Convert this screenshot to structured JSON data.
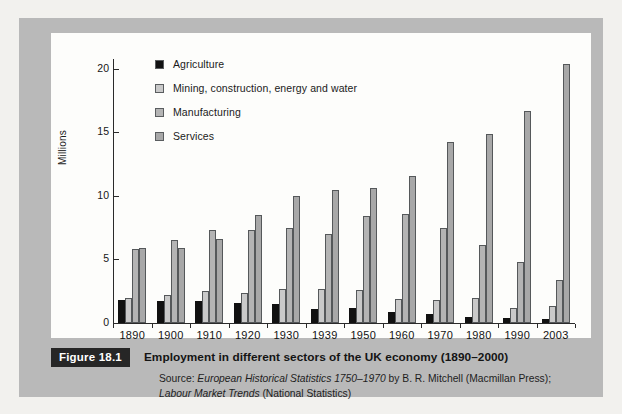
{
  "figure": {
    "badge": "Figure 18.1",
    "title": "Employment in different sectors of the UK economy (1890–2000)",
    "source_prefix": "Source: ",
    "source_italic_1": "European Historical Statistics 1750–1970",
    "source_rest_1": " by B. R. Mitchell (Macmillan Press);",
    "source_italic_2": "Labour Market Trends",
    "source_rest_2": " (National Statistics)",
    "ghost_text": "Labour markets and industrial relations"
  },
  "colors": {
    "page_background": "#f2f1ee",
    "figure_block": "#b9b9b9",
    "chart_panel": "#fdfdfb",
    "axis": "#2a2a2a",
    "badge_background": "#262626",
    "badge_text": "#ffffff",
    "agriculture": "#111111",
    "mining": "#c9c9c9",
    "manufacturing": "#b4b4b4",
    "services": "#a8a8a8",
    "bar_border": "#55585a"
  },
  "chart_data": {
    "type": "bar",
    "title": "Employment in different sectors of the UK economy (1890–2000)",
    "xlabel": "",
    "ylabel": "Millions",
    "ylim": [
      0,
      21
    ],
    "yticks": [
      0,
      5,
      10,
      15,
      20
    ],
    "ytick_labels": [
      "0",
      "5",
      "10",
      "15",
      "20"
    ],
    "grid": false,
    "legend_position": "top-left-inside",
    "categories": [
      "1890",
      "1900",
      "1910",
      "1920",
      "1930",
      "1939",
      "1950",
      "1960",
      "1970",
      "1980",
      "1990",
      "2003"
    ],
    "series": [
      {
        "name": "Agriculture",
        "color": "#111111",
        "values": [
          1.8,
          1.7,
          1.7,
          1.6,
          1.5,
          1.1,
          1.2,
          0.9,
          0.7,
          0.5,
          0.4,
          0.3
        ]
      },
      {
        "name": "Mining, construction, energy and water",
        "color": "#c9c9c9",
        "values": [
          2.0,
          2.2,
          2.5,
          2.4,
          2.7,
          2.7,
          2.6,
          1.9,
          1.8,
          2.0,
          1.2,
          1.3
        ]
      },
      {
        "name": "Manufacturing",
        "color": "#b4b4b4",
        "values": [
          5.8,
          6.5,
          7.3,
          7.3,
          7.5,
          7.0,
          8.4,
          8.6,
          7.5,
          6.1,
          4.8,
          3.4
        ]
      },
      {
        "name": "Services",
        "color": "#a8a8a8",
        "values": [
          5.9,
          5.9,
          6.6,
          8.5,
          10.0,
          10.5,
          10.6,
          11.6,
          14.2,
          14.9,
          16.7,
          20.4
        ]
      }
    ]
  }
}
